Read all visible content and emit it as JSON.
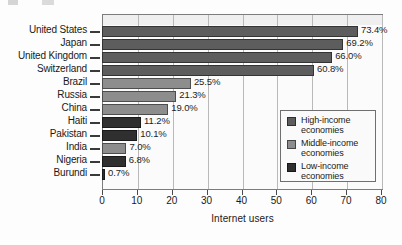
{
  "chart_data": {
    "type": "bar",
    "orientation": "horizontal",
    "title": "",
    "xlabel": "Internet users",
    "ylabel": "",
    "xlim": [
      0,
      80
    ],
    "xticks": [
      0,
      10,
      20,
      30,
      40,
      50,
      60,
      70,
      80
    ],
    "grid": true,
    "legend_position": "center-right",
    "categories": [
      "United States",
      "Japan",
      "United Kingdom",
      "Switzerland",
      "Brazil",
      "Russia",
      "China",
      "Haiti",
      "Pakistan",
      "India",
      "Nigeria",
      "Burundi"
    ],
    "values": [
      73.4,
      69.2,
      66.0,
      60.8,
      25.5,
      21.3,
      19.0,
      11.2,
      10.1,
      7.0,
      6.8,
      0.7
    ],
    "value_labels": [
      "73.4%",
      "69.2%",
      "66.0%",
      "60.8%",
      "25.5%",
      "21.3%",
      "19.0%",
      "11.2%",
      "10.1%",
      "7.0%",
      "6.8%",
      "0.7%"
    ],
    "groups": [
      "high",
      "high",
      "high",
      "high",
      "middle",
      "middle",
      "middle",
      "low",
      "low",
      "middle",
      "low",
      "low"
    ],
    "series": [
      {
        "name": "High-income economies",
        "group": "high",
        "color": "#5d5d5d",
        "points": [
          {
            "category": "United States",
            "value": 73.4
          },
          {
            "category": "Japan",
            "value": 69.2
          },
          {
            "category": "United Kingdom",
            "value": 66.0
          },
          {
            "category": "Switzerland",
            "value": 60.8
          }
        ]
      },
      {
        "name": "Middle-income economies",
        "group": "middle",
        "color": "#8d8d8d",
        "points": [
          {
            "category": "Brazil",
            "value": 25.5
          },
          {
            "category": "Russia",
            "value": 21.3
          },
          {
            "category": "China",
            "value": 19.0
          },
          {
            "category": "India",
            "value": 7.0
          }
        ]
      },
      {
        "name": "Low-income economies",
        "group": "low",
        "color": "#2f2f2f",
        "points": [
          {
            "category": "Haiti",
            "value": 11.2
          },
          {
            "category": "Pakistan",
            "value": 10.1
          },
          {
            "category": "Nigeria",
            "value": 6.8
          },
          {
            "category": "Burundi",
            "value": 0.7
          }
        ]
      }
    ]
  },
  "legend": {
    "items": [
      {
        "label_line1": "High-income",
        "label_line2": "economies",
        "group": "high"
      },
      {
        "label_line1": "Middle-income",
        "label_line2": "economies",
        "group": "middle"
      },
      {
        "label_line1": "Low-income",
        "label_line2": "economies",
        "group": "low"
      }
    ]
  },
  "colors": {
    "high_income": "#5d5d5d",
    "middle_income": "#8d8d8d",
    "low_income": "#2f2f2f",
    "plot_background": "#fbfbfb",
    "frame": "#7c7c7c",
    "gridline": "#b9b9b9"
  }
}
